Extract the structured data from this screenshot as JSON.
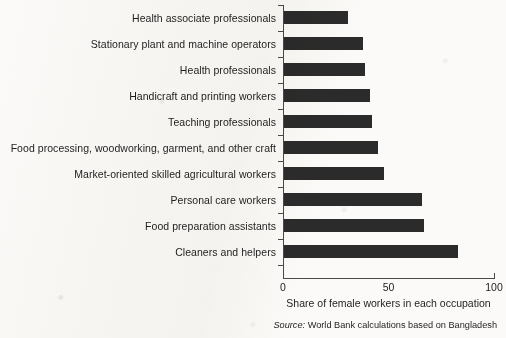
{
  "chart_data": {
    "type": "bar",
    "orientation": "horizontal",
    "title": "",
    "subtitle": "",
    "xlabel": "Share of female workers in each occupation",
    "ylabel": "",
    "xlim": [
      0,
      100
    ],
    "xticks": [
      "0",
      "50",
      "100"
    ],
    "xtick_values": [
      0,
      50,
      100
    ],
    "grid": false,
    "legend": false,
    "categories": [
      "Health associate professionals",
      "Stationary plant and machine operators",
      "Health professionals",
      "Handicraft and printing workers",
      "Teaching professionals",
      "Food processing, woodworking, garment, and other craft",
      "Market-oriented skilled agricultural workers",
      "Personal care workers",
      "Food preparation assistants",
      "Cleaners and helpers"
    ],
    "values": [
      31,
      38,
      39,
      41,
      42,
      45,
      48,
      66,
      67,
      83
    ],
    "bar_color": "#2b2b2b",
    "axis_color": "#4a4a4a",
    "background_color": "#fbfaf8"
  },
  "source": {
    "keyword": "Source:",
    "text": "World Bank calculations based on Bangladesh"
  }
}
